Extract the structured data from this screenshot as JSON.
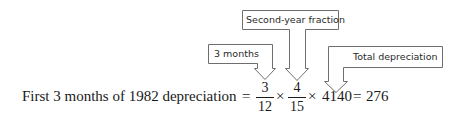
{
  "callouts": [
    {
      "id": "three-months",
      "label": "3 months"
    },
    {
      "id": "second-year-fraction",
      "label": "Second-year fraction"
    },
    {
      "id": "total-depreciation",
      "label": "Total depreciation"
    }
  ],
  "equation": {
    "lhs": "First 3 months of 1982 depreciation",
    "equals1": "=",
    "fraction1": {
      "numerator": "3",
      "denominator": "12"
    },
    "times1": "×",
    "fraction2": {
      "numerator": "4",
      "denominator": "15"
    },
    "times2": "×",
    "total": "4140",
    "equals2": "=",
    "result": "276"
  },
  "colors": {
    "outline": "#6e6e6e",
    "text": "#1a1a1a"
  }
}
